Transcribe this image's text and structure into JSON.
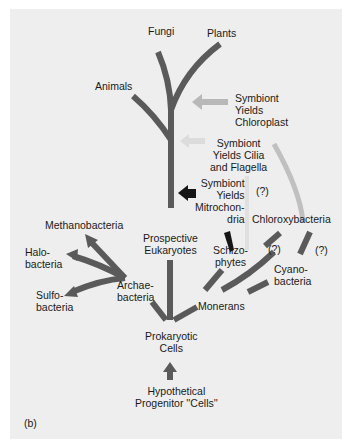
{
  "figure": {
    "panel_label": "(b)",
    "colors": {
      "background": "#eeeeee",
      "branch": "#5a5a5a",
      "light_arrow": "#b8b8b8",
      "lighter_arrow": "#d4d4d4",
      "dark_arrow": "#151515",
      "text": "#1a1a1a"
    },
    "nodes": {
      "fungi": "Fungi",
      "plants": "Plants",
      "animals": "Animals",
      "symbiont_chloroplast": "Symbiont\nYields\nChloroplast",
      "symbiont_cilia": "Symbiont\nYields Cilia\nand Flagella",
      "symbiont_mito": "Symbiont\nYields\nMitrochon-\ndria",
      "question_1": "(?)",
      "chloroxybacteria": "Chloroxybacteria",
      "methanobacteria": "Methanobacteria",
      "halobacteria": "Halo-\nbacteria",
      "sulfobacteria": "Sulfo-\nbacteria",
      "archaebacteria": "Archae-\nbacteria",
      "prospective_eukaryotes": "Prospective\nEukaryotes",
      "schizophytes": "Schizo-\nphytes",
      "question_2": "(?)",
      "question_3": "(?)",
      "cyanobacteria": "Cyano-\nbacteria",
      "monerans": "Monerans",
      "prokaryotic_cells": "Prokaryotic\nCells",
      "progenitor": "Hypothetical\nProgenitor ''Cells''"
    }
  }
}
